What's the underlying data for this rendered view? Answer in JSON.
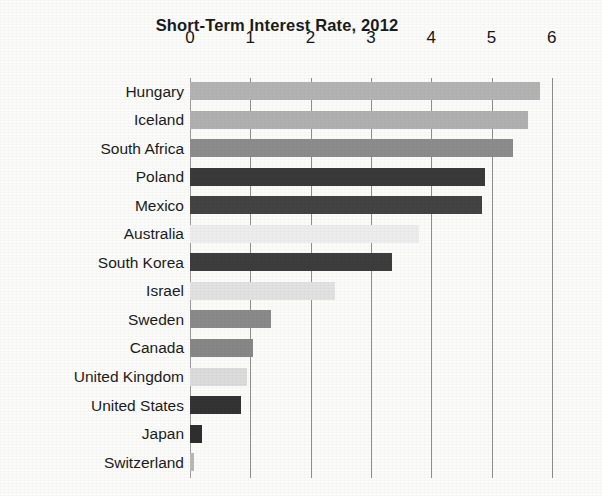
{
  "chart_data": {
    "type": "bar",
    "orientation": "horizontal",
    "title": "Short-Term Interest Rate, 2012",
    "xlabel": "",
    "ylabel": "",
    "xlim": [
      0,
      6
    ],
    "xticks": [
      "0",
      "1",
      "2",
      "3",
      "4",
      "5",
      "6"
    ],
    "xtick_values": [
      0,
      1,
      2,
      3,
      4,
      5,
      6
    ],
    "grid": "vertical",
    "legend": "none",
    "categories": [
      "Hungary",
      "Iceland",
      "South Africa",
      "Poland",
      "Mexico",
      "Australia",
      "South Korea",
      "Israel",
      "Sweden",
      "Canada",
      "United Kingdom",
      "United States",
      "Japan",
      "Switzerland"
    ],
    "values": [
      5.8,
      5.6,
      5.35,
      4.9,
      4.85,
      3.8,
      3.35,
      2.4,
      1.35,
      1.05,
      0.95,
      0.85,
      0.2,
      0.07
    ],
    "bar_colors": [
      "#b3b3b3",
      "#b0b0b0",
      "#8c8c8c",
      "#3a3a3a",
      "#434343",
      "#ededed",
      "#3d3d3d",
      "#e2e2e2",
      "#8a8a8a",
      "#878787",
      "#dcdcdc",
      "#333333",
      "#2e2e2e",
      "#b9b9b9"
    ]
  },
  "colors": {
    "background": "#fbfbfa",
    "gridline": "#8e8e8e",
    "text": "#1b1b1b"
  }
}
